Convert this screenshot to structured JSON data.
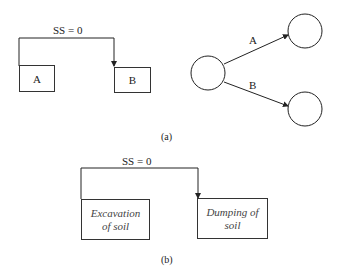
{
  "part_a": {
    "constraint_label": "SS = 0",
    "box_a_label": "A",
    "box_b_label": "B",
    "arrow_a_label": "A",
    "arrow_b_label": "B",
    "caption": "(a)"
  },
  "part_b": {
    "constraint_label": "SS = 0",
    "activity_1_line1": "Excavation",
    "activity_1_line2": "of soil",
    "activity_2_line1": "Dumping of",
    "activity_2_line2": "soil",
    "caption": "(b)"
  }
}
